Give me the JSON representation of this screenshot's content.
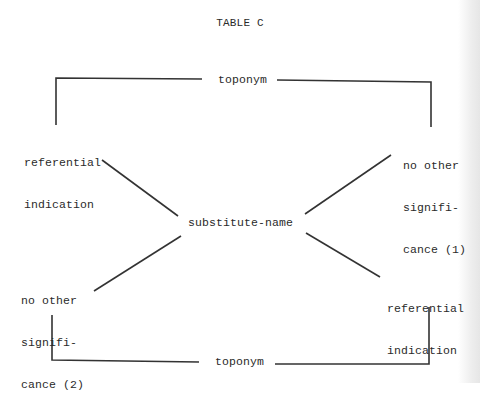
{
  "title": "TABLE C",
  "nodes": {
    "top_toponym": "toponym",
    "bottom_toponym": "toponym",
    "center": "substitute-name",
    "upper_left": {
      "lines": [
        "referential",
        "indication"
      ]
    },
    "upper_right": {
      "lines": [
        "no other",
        "signifi-",
        "cance (1)"
      ]
    },
    "lower_left": {
      "lines": [
        "no other",
        "signifi-",
        "cance (2)"
      ]
    },
    "lower_right": {
      "lines": [
        "referential",
        "indication"
      ]
    }
  },
  "colors": {
    "background": "#ffffff",
    "ink": "#2a2a2a"
  }
}
